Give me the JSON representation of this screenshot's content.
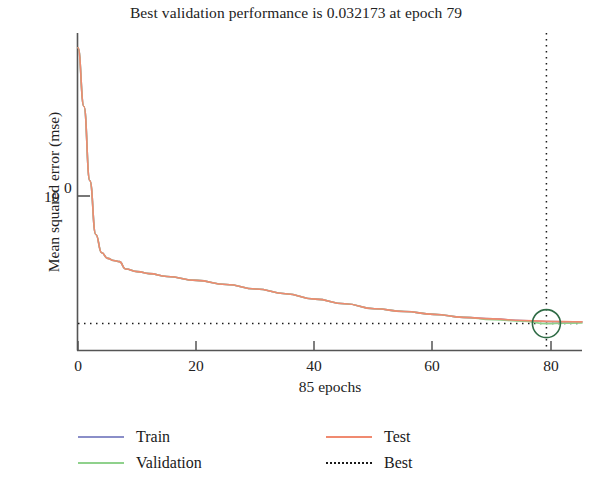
{
  "chart_data": {
    "type": "line",
    "title": "Best validation performance is 0.032173 at epoch 79",
    "xlabel": "85 epochs",
    "ylabel": "Mean squared error (mse)",
    "yscale": "log",
    "xlim": [
      0,
      85
    ],
    "ylim": [
      0.02,
      6.0
    ],
    "xticks": [
      "0",
      "20",
      "40",
      "60",
      "80"
    ],
    "xtick_values": [
      0,
      20,
      40,
      60,
      80
    ],
    "yticks": [
      "10",
      "0"
    ],
    "ytick_values": [
      1
    ],
    "grid": false,
    "legend_position": "below",
    "best_epoch": 79,
    "best_value": 0.032173,
    "annotations": {
      "best_marker": "circle-at-epoch-79",
      "best_vertical_line": "dotted vertical at epoch 79",
      "best_horizontal_line": "dotted horizontal at mse 0.032173"
    },
    "colors": {
      "train": "#8a8ec8",
      "validation": "#8fd18c",
      "test": "#f08a70",
      "best": "#1a1a1a",
      "marker": "#2f6b45",
      "axis": "#555555"
    },
    "series": [
      {
        "name": "Train",
        "color": "#8a8ec8",
        "x": [
          0,
          1,
          2,
          3,
          4,
          5,
          6,
          7,
          8,
          10,
          12,
          15,
          20,
          25,
          30,
          35,
          40,
          45,
          50,
          55,
          60,
          65,
          70,
          75,
          79,
          82,
          85
        ],
        "values": [
          4.6,
          1.6,
          0.42,
          0.16,
          0.115,
          0.104,
          0.1,
          0.098,
          0.086,
          0.082,
          0.079,
          0.075,
          0.07,
          0.065,
          0.06,
          0.055,
          0.05,
          0.046,
          0.042,
          0.04,
          0.038,
          0.036,
          0.035,
          0.034,
          0.0334,
          0.0332,
          0.0331
        ]
      },
      {
        "name": "Validation",
        "color": "#8fd18c",
        "x": [
          0,
          1,
          2,
          3,
          4,
          5,
          6,
          7,
          8,
          10,
          12,
          15,
          20,
          25,
          30,
          35,
          40,
          45,
          50,
          55,
          60,
          65,
          70,
          75,
          79,
          82,
          85
        ],
        "values": [
          4.6,
          1.6,
          0.42,
          0.16,
          0.115,
          0.104,
          0.1,
          0.098,
          0.086,
          0.082,
          0.079,
          0.075,
          0.07,
          0.065,
          0.06,
          0.055,
          0.05,
          0.046,
          0.042,
          0.04,
          0.038,
          0.036,
          0.0345,
          0.0336,
          0.032173,
          0.0324,
          0.0325
        ]
      },
      {
        "name": "Test",
        "color": "#f08a70",
        "x": [
          0,
          1,
          2,
          3,
          4,
          5,
          6,
          7,
          8,
          10,
          12,
          15,
          20,
          25,
          30,
          35,
          40,
          45,
          50,
          55,
          60,
          65,
          70,
          75,
          79,
          82,
          85
        ],
        "values": [
          4.6,
          1.6,
          0.42,
          0.16,
          0.115,
          0.104,
          0.1,
          0.098,
          0.086,
          0.082,
          0.079,
          0.075,
          0.07,
          0.065,
          0.06,
          0.055,
          0.05,
          0.046,
          0.042,
          0.04,
          0.038,
          0.036,
          0.035,
          0.034,
          0.0335,
          0.0333,
          0.0332
        ]
      }
    ]
  },
  "legend": {
    "items": [
      {
        "label": "Train",
        "style": "solid",
        "color": "#8a8ec8"
      },
      {
        "label": "Test",
        "style": "solid",
        "color": "#f08a70"
      },
      {
        "label": "Validation",
        "style": "solid",
        "color": "#8fd18c"
      },
      {
        "label": "Best",
        "style": "dotted",
        "color": "#1a1a1a"
      }
    ]
  }
}
